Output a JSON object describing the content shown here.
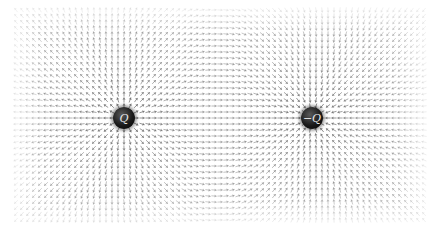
{
  "diagram": {
    "type": "vector-field",
    "field_region": {
      "x0": 16,
      "y0": 10,
      "x1": 425,
      "y1": 222
    },
    "grid_spacing": 6,
    "arrow_color": "#6e6e6e",
    "charges": [
      {
        "label": "Q",
        "x": 124,
        "y": 118,
        "sign": 1
      },
      {
        "label": "−Q",
        "x": 312,
        "y": 118,
        "sign": -1
      }
    ]
  }
}
